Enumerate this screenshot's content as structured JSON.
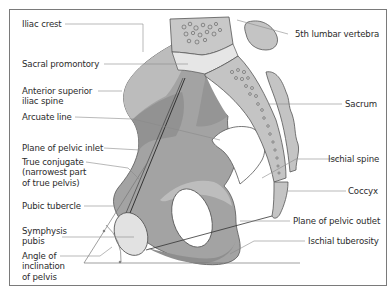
{
  "diagram": {
    "type": "anatomical-illustration",
    "colors": {
      "bone_dark": "#8f8f8f",
      "bone_mid": "#a8a8a8",
      "bone_light": "#c4c4c4",
      "bone_pale": "#dedede",
      "outline": "#555555",
      "leader_line": "#8a8a8a",
      "frame": "#7a7a7a",
      "text": "#2b2b2b"
    },
    "labels_left": [
      {
        "id": "iliac-crest",
        "text": "Iliac crest"
      },
      {
        "id": "sacral-promontory",
        "text": "Sacral promontory"
      },
      {
        "id": "anterior-superior-iliac-spine",
        "line1": "Anterior superior",
        "line2": "iliac spine"
      },
      {
        "id": "arcuate-line",
        "text": "Arcuate line"
      },
      {
        "id": "plane-of-pelvic-inlet",
        "text": "Plane of pelvic inlet"
      },
      {
        "id": "true-conjugate",
        "line1": "True conjugate",
        "line2": "(narrowest part",
        "line3": "of true pelvis)"
      },
      {
        "id": "pubic-tubercle",
        "text": "Pubic tubercle"
      },
      {
        "id": "symphysis-pubis",
        "line1": "Symphysis",
        "line2": "pubis"
      },
      {
        "id": "angle-of-inclination",
        "line1": "Angle of",
        "line2": "inclination",
        "line3": "of pelvis"
      }
    ],
    "labels_right": [
      {
        "id": "5th-lumbar-vertebra",
        "text": "5th lumbar vertebra"
      },
      {
        "id": "sacrum",
        "text": "Sacrum"
      },
      {
        "id": "ischial-spine",
        "text": "Ischial spine"
      },
      {
        "id": "coccyx",
        "text": "Coccyx"
      },
      {
        "id": "plane-of-pelvic-outlet",
        "text": "Plane of pelvic outlet"
      },
      {
        "id": "ischial-tuberosity",
        "text": "Ischial tuberosity"
      }
    ]
  }
}
